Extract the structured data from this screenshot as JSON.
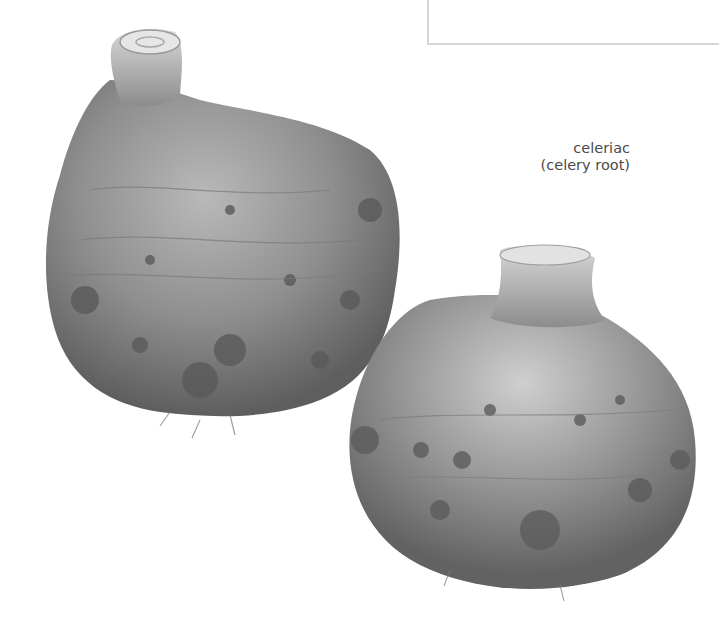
{
  "caption": {
    "line1": "celeriac",
    "line2": "(celery root)"
  },
  "subjects": [
    {
      "name": "celeriac-root-large",
      "description": "grayscale photo of a large celeriac with trimmed stalk top"
    },
    {
      "name": "celeriac-root-small",
      "description": "grayscale photo of a smaller celeriac with trimmed stalk top"
    }
  ],
  "colors": {
    "background": "#ffffff",
    "box_border": "#d6d6d6",
    "caption_text": "#4a4a4a",
    "root_mid": "#8a8a8a",
    "root_dark": "#5a5a5a",
    "root_light": "#c8c8c8"
  }
}
